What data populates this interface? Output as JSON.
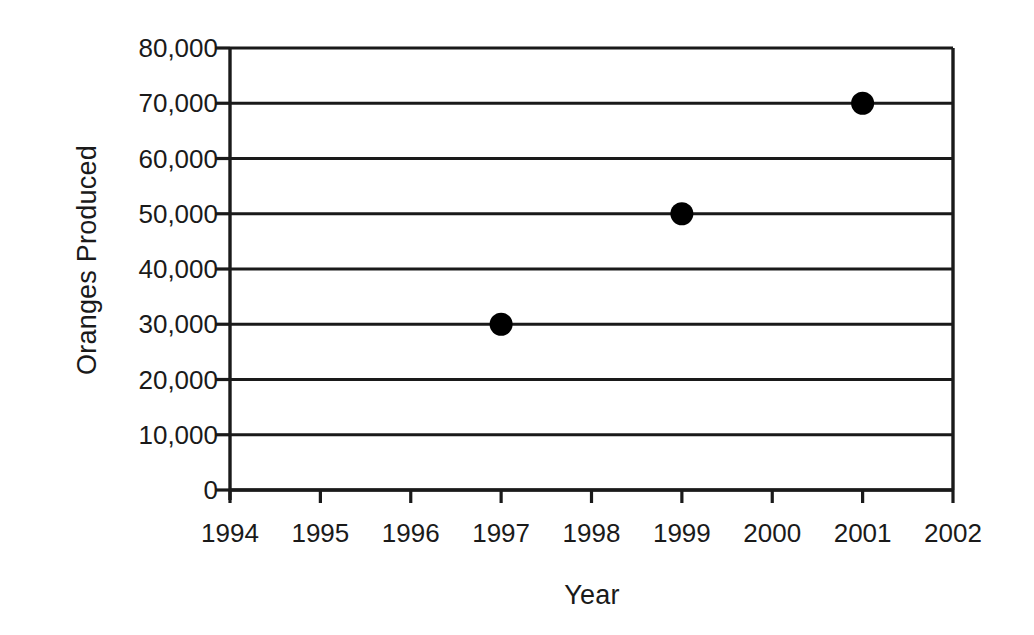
{
  "chart_data": {
    "type": "scatter",
    "title": "",
    "xlabel": "Year",
    "ylabel": "Oranges Produced",
    "x": [
      1997,
      1999,
      2001
    ],
    "values": [
      30000,
      50000,
      70000
    ],
    "points": [
      {
        "x": 1997,
        "y": 30000,
        "label": "30,000"
      },
      {
        "x": 1999,
        "y": 50000,
        "label": "50,000"
      },
      {
        "x": 2001,
        "y": 70000,
        "label": "70,000"
      }
    ],
    "series": [
      {
        "name": "Oranges Produced",
        "marker": "filled-circle",
        "color": "#000000",
        "values": [
          30000,
          50000,
          70000
        ]
      }
    ],
    "xlim": [
      1994,
      2002
    ],
    "ylim": [
      0,
      80000
    ],
    "x_tick_labels": [
      "1994",
      "1995",
      "1996",
      "1997",
      "1998",
      "1999",
      "2000",
      "2001",
      "2002"
    ],
    "x_tick_values": [
      1994,
      1995,
      1996,
      1997,
      1998,
      1999,
      2000,
      2001,
      2002
    ],
    "y_tick_labels": [
      "0",
      "10,000",
      "20,000",
      "30,000",
      "40,000",
      "50,000",
      "60,000",
      "70,000",
      "80,000"
    ],
    "y_tick_values": [
      0,
      10000,
      20000,
      30000,
      40000,
      50000,
      60000,
      70000,
      80000
    ],
    "grid": {
      "horizontal": true,
      "vertical": false
    },
    "legend": {
      "visible": false,
      "position": "none"
    },
    "colors": {
      "axis": "#1a1a1a",
      "gridline": "#1a1a1a",
      "marker": "#000000",
      "background": "#ffffff",
      "text": "#1a1a1a"
    }
  }
}
